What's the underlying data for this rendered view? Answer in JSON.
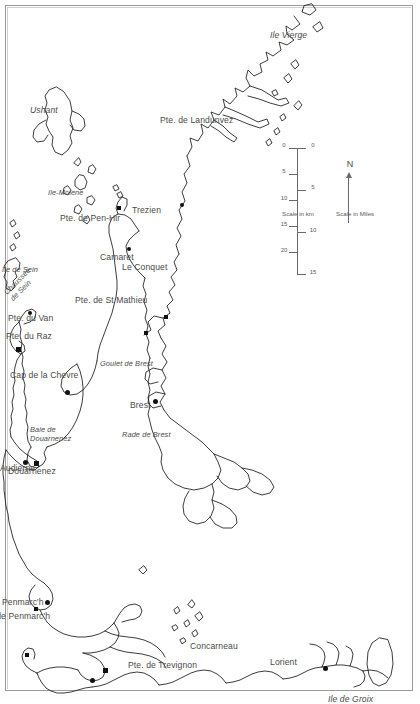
{
  "map": {
    "title": "Coast of western Brittany (Finistere)",
    "orientation_note": "map rotated 90 degrees clockwise on the page",
    "background_color": "#ffffff",
    "coastline_color": "#1a1a1a",
    "label_color": "#4a4a4a",
    "compass": {
      "label": "N",
      "points": "left"
    },
    "scale": {
      "miles_caption": "Scale in Miles",
      "km_caption": "Scale in km",
      "miles_ticks": [
        "0",
        "5",
        "10",
        "15"
      ],
      "km_ticks": [
        "0",
        "5",
        "10",
        "15",
        "20"
      ]
    },
    "labels": [
      {
        "id": "ile-vierge",
        "text": "Ile Vierge",
        "style": "italic"
      },
      {
        "id": "pte-de-landunvez",
        "text": "Pte. de Landunvez",
        "style": "plain"
      },
      {
        "id": "trezien",
        "text": "Trezien",
        "style": "plain"
      },
      {
        "id": "le-conquet",
        "text": "Le Conquet",
        "style": "plain"
      },
      {
        "id": "pte-de-st-mathieu",
        "text": "Pte. de St Mathieu",
        "style": "plain"
      },
      {
        "id": "ushant",
        "text": "Ushant",
        "style": "italic"
      },
      {
        "id": "ile-molene",
        "text": "Ile-Molene",
        "style": "italic"
      },
      {
        "id": "brest",
        "text": "Brest",
        "style": "plain"
      },
      {
        "id": "goulet-de-brest",
        "text": "Goulet de Brest",
        "style": "italic"
      },
      {
        "id": "rade-de-brest",
        "text": "Rade de Brest",
        "style": "italic"
      },
      {
        "id": "camaret",
        "text": "Camaret",
        "style": "plain"
      },
      {
        "id": "pte-de-pen-hir",
        "text": "Pte. de Pen-Hir",
        "style": "plain"
      },
      {
        "id": "cap-de-la-chevre",
        "text": "Cap de la Chevre",
        "style": "plain"
      },
      {
        "id": "baie-de-douarnenez",
        "text": "Baie de\nDouarnenez",
        "style": "italic"
      },
      {
        "id": "douarnenez",
        "text": "Douarnenez",
        "style": "plain"
      },
      {
        "id": "audierne",
        "text": "Audierne",
        "style": "plain"
      },
      {
        "id": "pte-du-van",
        "text": "Pte. du Van",
        "style": "plain"
      },
      {
        "id": "pte-du-raz",
        "text": "Pte. du Raz",
        "style": "plain"
      },
      {
        "id": "chaussee-de-sein",
        "text": "Chaussee\nde Sein",
        "style": "italic"
      },
      {
        "id": "ile-de-sein",
        "text": "Ile de Sein",
        "style": "italic"
      },
      {
        "id": "penmarch",
        "text": "Penmarc'h",
        "style": "plain"
      },
      {
        "id": "pte-de-penmarch",
        "text": "Pte. de Penmarc'h",
        "style": "plain"
      },
      {
        "id": "pte-de-trevignon",
        "text": "Pte. de Trevignon",
        "style": "plain"
      },
      {
        "id": "concarneau",
        "text": "Concarneau",
        "style": "plain"
      },
      {
        "id": "lorient",
        "text": "Lorient",
        "style": "plain"
      },
      {
        "id": "ile-de-groix",
        "text": "Ile de Groix",
        "style": "italic"
      }
    ]
  }
}
